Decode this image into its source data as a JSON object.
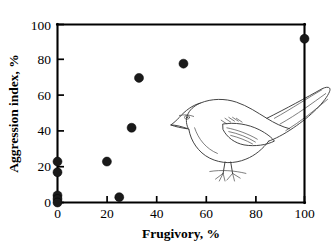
{
  "chart_data": {
    "type": "scatter",
    "title": "",
    "xlabel": "Frugivory, %",
    "ylabel": "Aggression index, %",
    "xlim": [
      0,
      100
    ],
    "ylim": [
      0,
      100
    ],
    "xticks": [
      0,
      20,
      40,
      60,
      80,
      100
    ],
    "yticks": [
      0,
      20,
      40,
      60,
      80,
      100
    ],
    "grid": false,
    "legend": null,
    "marker": {
      "shape": "filled-circle",
      "color": "#1a1a1a",
      "size": 7
    },
    "points": [
      {
        "x": 0,
        "y": 23
      },
      {
        "x": 0,
        "y": 17
      },
      {
        "x": 0,
        "y": 4
      },
      {
        "x": 0,
        "y": 2
      },
      {
        "x": 0,
        "y": 0
      },
      {
        "x": 20,
        "y": 23
      },
      {
        "x": 25,
        "y": 3
      },
      {
        "x": 30,
        "y": 42
      },
      {
        "x": 33,
        "y": 70
      },
      {
        "x": 51,
        "y": 78
      },
      {
        "x": 100,
        "y": 92
      }
    ],
    "annotations": [
      {
        "kind": "illustration",
        "name": "mockingbird-line-drawing",
        "x": 46,
        "y": 38
      }
    ]
  },
  "axes": {
    "x_tick_labels": [
      "0",
      "20",
      "40",
      "60",
      "80",
      "100"
    ],
    "y_tick_labels": [
      "0",
      "20",
      "40",
      "60",
      "80",
      "100"
    ],
    "x_title": "Frugivory, %",
    "y_title": "Aggression index, %"
  },
  "illustration": {
    "name": "mockingbird-line-drawing",
    "description": "mockingbird"
  }
}
